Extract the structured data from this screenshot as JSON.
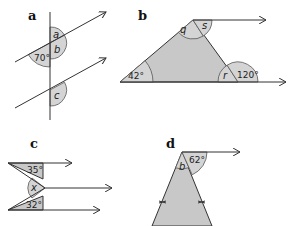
{
  "diagrams": [
    {
      "id": "a",
      "label": "a",
      "angles": {
        "a": "a",
        "b": "b",
        "given": "70°",
        "c": "c"
      }
    },
    {
      "id": "b",
      "label": "b",
      "angles": {
        "q": "q",
        "s": "s",
        "left": "42°",
        "r": "r",
        "exterior": "120°"
      }
    },
    {
      "id": "c",
      "label": "c",
      "angles": {
        "top": "35°",
        "x": "x",
        "bottom": "32°"
      }
    },
    {
      "id": "d",
      "label": "d",
      "angles": {
        "b": "b",
        "given": "62°"
      }
    }
  ],
  "colors": {
    "shade": "#c8c8c8",
    "arc": "#d4d4d4",
    "line": "#333333"
  }
}
